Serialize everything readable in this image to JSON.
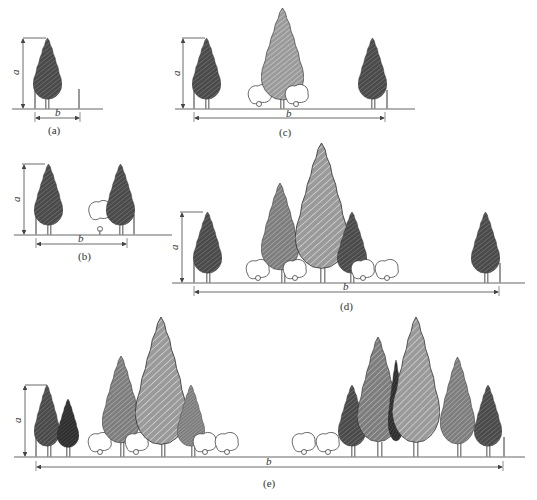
{
  "figure": {
    "panels": [
      {
        "id": "a",
        "caption": "(a)",
        "height_label": "a",
        "width_label": "b"
      },
      {
        "id": "b",
        "caption": "(b)",
        "height_label": "a",
        "width_label": "b"
      },
      {
        "id": "c",
        "caption": "(c)",
        "height_label": "a",
        "width_label": "b"
      },
      {
        "id": "d",
        "caption": "(d)",
        "height_label": "a",
        "width_label": "b"
      },
      {
        "id": "e",
        "caption": "(e)",
        "height_label": "a",
        "width_label": "b"
      }
    ],
    "colors": {
      "dark_tree": "#555555",
      "darker_tree": "#3a3a3a",
      "medium_tree": "#8a8a8a",
      "light_tree": "#a8a8a8",
      "line": "#444444",
      "ground": "#666666"
    }
  }
}
